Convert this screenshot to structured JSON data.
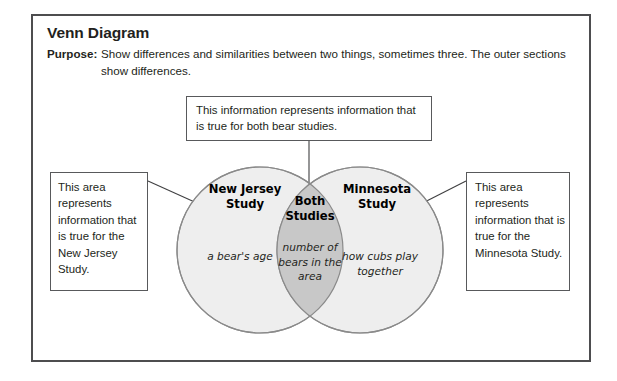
{
  "card": {
    "title": "Venn Diagram",
    "purpose_label": "Purpose:",
    "purpose_text": "Show differences and similarities between two things, sometimes three. The outer sections show differences."
  },
  "callouts": {
    "top": "This information represents information that is true for both bear studies.",
    "left": "This area represents information that is true for the New Jersey Study.",
    "right": "This area represents information that is true for the Minnesota Study."
  },
  "venn": {
    "left_circle": {
      "label": "New Jersey Study",
      "item": "a bear's age"
    },
    "overlap": {
      "label": "Both Studies",
      "item": "number of bears in the area"
    },
    "right_circle": {
      "label": "Minnesota Study",
      "item": "how cubs play together"
    }
  },
  "colors": {
    "frame": "#4d4d4f",
    "circle_fill": "#eeeeee",
    "overlap_fill": "#c8c8c8",
    "circle_stroke": "#8a8a8a",
    "box_stroke": "#58595b",
    "text": "#231f20",
    "arrow": "#3f3f41"
  }
}
